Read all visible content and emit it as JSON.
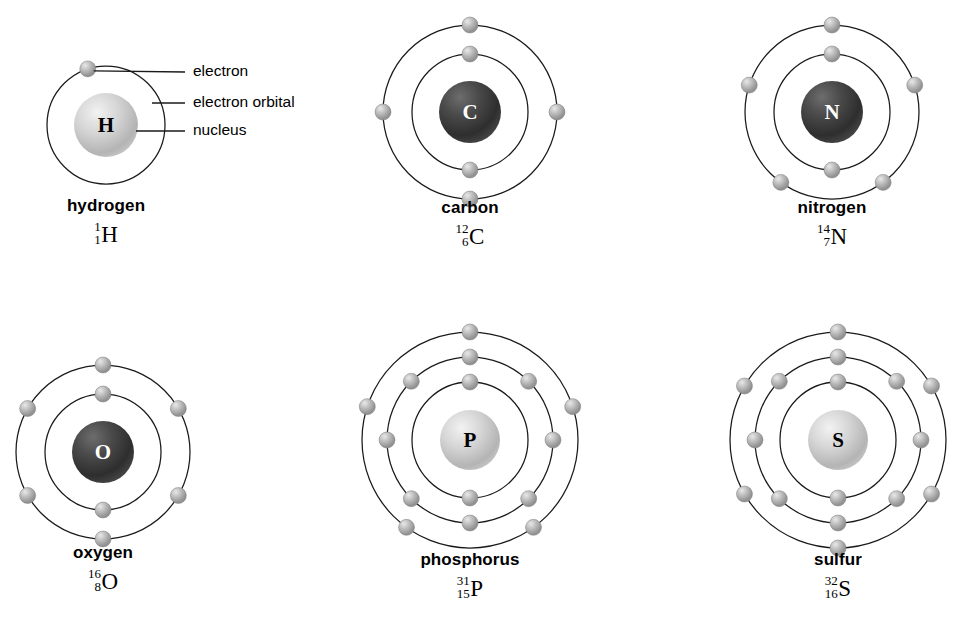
{
  "diagram": {
    "background_color": "#ffffff",
    "orbit_stroke_color": "#1a1a1a",
    "electron_color": "#9a9a9a",
    "callouts": [
      {
        "id": "electron",
        "label": "electron"
      },
      {
        "id": "electron-orbital",
        "label": "electron orbital"
      },
      {
        "id": "nucleus",
        "label": "nucleus"
      }
    ],
    "atoms": [
      {
        "id": "hydrogen",
        "name": "hydrogen",
        "symbol": "H",
        "mass_number": "1",
        "atomic_number": "1",
        "nucleus_style": "light",
        "nucleus_label_color": "#000000",
        "nucleus_radius": 32,
        "shells": [
          {
            "radius": 59,
            "electrons": 1,
            "start_angle": -108
          }
        ]
      },
      {
        "id": "carbon",
        "name": "carbon",
        "symbol": "C",
        "mass_number": "12",
        "atomic_number": "6",
        "nucleus_style": "dark",
        "nucleus_label_color": "#ffffff",
        "nucleus_radius": 31,
        "shells": [
          {
            "radius": 58,
            "electrons": 2,
            "start_angle": -90
          },
          {
            "radius": 87,
            "electrons": 4,
            "start_angle": -90
          }
        ]
      },
      {
        "id": "nitrogen",
        "name": "nitrogen",
        "symbol": "N",
        "mass_number": "14",
        "atomic_number": "7",
        "nucleus_style": "dark",
        "nucleus_label_color": "#ffffff",
        "nucleus_radius": 31,
        "shells": [
          {
            "radius": 58,
            "electrons": 2,
            "start_angle": -90
          },
          {
            "radius": 87,
            "electrons": 5,
            "start_angle": -90
          }
        ]
      },
      {
        "id": "oxygen",
        "name": "oxygen",
        "symbol": "O",
        "mass_number": "16",
        "atomic_number": "8",
        "nucleus_style": "dark",
        "nucleus_label_color": "#ffffff",
        "nucleus_radius": 31,
        "shells": [
          {
            "radius": 58,
            "electrons": 2,
            "start_angle": -90
          },
          {
            "radius": 87,
            "electrons": 6,
            "start_angle": -90
          }
        ]
      },
      {
        "id": "phosphorus",
        "name": "phosphorus",
        "symbol": "P",
        "mass_number": "31",
        "atomic_number": "15",
        "nucleus_style": "light",
        "nucleus_label_color": "#000000",
        "nucleus_radius": 30,
        "shells": [
          {
            "radius": 58,
            "electrons": 2,
            "start_angle": -90
          },
          {
            "radius": 83,
            "electrons": 8,
            "start_angle": -90
          },
          {
            "radius": 108,
            "electrons": 5,
            "start_angle": -90
          }
        ]
      },
      {
        "id": "sulfur",
        "name": "sulfur",
        "symbol": "S",
        "mass_number": "32",
        "atomic_number": "16",
        "nucleus_style": "light",
        "nucleus_label_color": "#000000",
        "nucleus_radius": 30,
        "shells": [
          {
            "radius": 58,
            "electrons": 2,
            "start_angle": -90
          },
          {
            "radius": 83,
            "electrons": 8,
            "start_angle": -90
          },
          {
            "radius": 108,
            "electrons": 6,
            "start_angle": -90
          }
        ]
      }
    ],
    "layout": {
      "cells": [
        {
          "id": "hydrogen",
          "cx": 106,
          "cy": 125,
          "caption_y": 197,
          "box": 250
        },
        {
          "id": "carbon",
          "cx": 470,
          "cy": 112,
          "caption_y": 199,
          "box": 250
        },
        {
          "id": "nitrogen",
          "cx": 832,
          "cy": 112,
          "caption_y": 199,
          "box": 250
        },
        {
          "id": "oxygen",
          "cx": 103,
          "cy": 452,
          "caption_y": 544,
          "box": 250
        },
        {
          "id": "phosphorus",
          "cx": 470,
          "cy": 440,
          "caption_y": 551,
          "box": 260
        },
        {
          "id": "sulfur",
          "cx": 838,
          "cy": 440,
          "caption_y": 551,
          "box": 260
        }
      ]
    }
  }
}
